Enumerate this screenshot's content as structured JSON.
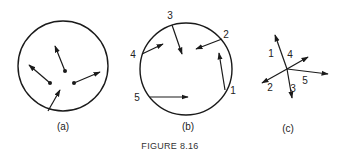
{
  "figure": {
    "caption": "FIGURE 8.16",
    "stroke_color": "#1a1a1a",
    "panels": [
      {
        "id": "a",
        "label": "(a)",
        "circle": {
          "cx": 63,
          "cy": 66,
          "r": 45
        },
        "arrows": [
          {
            "x1": 65,
            "y1": 71,
            "x2": 55,
            "y2": 46,
            "tail_dot": true
          },
          {
            "x1": 50,
            "y1": 83,
            "x2": 29,
            "y2": 65,
            "tail_dot": true
          },
          {
            "x1": 74,
            "y1": 83,
            "x2": 100,
            "y2": 72,
            "tail_dot": true
          },
          {
            "x1": 48,
            "y1": 111,
            "x2": 60,
            "y2": 90,
            "tail_dot": false
          }
        ]
      },
      {
        "id": "b",
        "label": "(b)",
        "circle": {
          "cx": 186,
          "cy": 69,
          "r": 46
        },
        "arrows": [
          {
            "num": "1",
            "x1": 225,
            "y1": 90,
            "x2": 219,
            "y2": 53,
            "lx": 233,
            "ly": 94
          },
          {
            "num": "2",
            "x1": 222,
            "y1": 39,
            "x2": 196,
            "y2": 49,
            "lx": 226,
            "ly": 38
          },
          {
            "num": "3",
            "x1": 172,
            "y1": 25,
            "x2": 182,
            "y2": 54,
            "lx": 170,
            "ly": 19
          },
          {
            "num": "4",
            "x1": 142,
            "y1": 54,
            "x2": 163,
            "y2": 44,
            "lx": 133,
            "ly": 58
          },
          {
            "num": "5",
            "x1": 150,
            "y1": 97,
            "x2": 188,
            "y2": 97,
            "lx": 137,
            "ly": 101
          }
        ]
      },
      {
        "id": "c",
        "label": "(c)",
        "origin": {
          "x": 287,
          "y": 69
        },
        "arrows": [
          {
            "num": "1",
            "x2": 275,
            "y2": 35,
            "lx": 271,
            "ly": 57
          },
          {
            "num": "2",
            "x2": 262,
            "y2": 83,
            "lx": 270,
            "ly": 91
          },
          {
            "num": "3",
            "x2": 292,
            "y2": 98,
            "lx": 293,
            "ly": 92
          },
          {
            "num": "4",
            "x2": 308,
            "y2": 57,
            "lx": 290,
            "ly": 58
          },
          {
            "num": "5",
            "x2": 328,
            "y2": 74,
            "lx": 305,
            "ly": 84
          }
        ]
      }
    ],
    "panel_labels_pos": [
      {
        "x": 63,
        "y": 130
      },
      {
        "x": 188,
        "y": 130
      },
      {
        "x": 288,
        "y": 132
      }
    ],
    "caption_pos": {
      "x": 170,
      "y": 149
    }
  }
}
